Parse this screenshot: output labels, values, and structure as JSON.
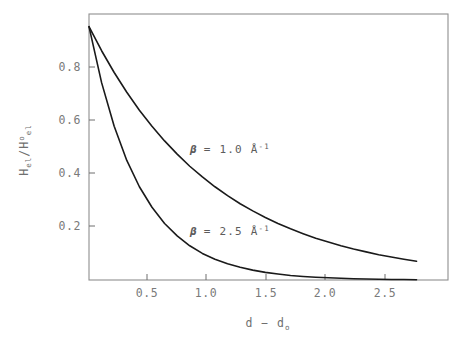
{
  "chart_data": {
    "type": "line",
    "title": "",
    "xlabel": "d - d",
    "xlabel_sub": "o",
    "ylabel_num": "H",
    "ylabel_num_sub": "el",
    "ylabel_den": "H",
    "ylabel_den_sup": "o",
    "ylabel_den_sub": "el",
    "ylabel_full": "H_el / H°_el",
    "xlim": [
      0,
      2.85
    ],
    "ylim": [
      0,
      1.05
    ],
    "xticks": [
      0.5,
      1.0,
      1.5,
      2.0,
      2.5
    ],
    "xtick_labels": [
      "0.5",
      "1.0",
      "1.5",
      "2.0",
      "2.5"
    ],
    "yticks": [
      0.2,
      0.4,
      0.6,
      0.8
    ],
    "ytick_labels": [
      "0.2",
      "0.4",
      "0.6",
      "0.8"
    ],
    "grid": false,
    "legend_position": "inline-annotation",
    "series": [
      {
        "name": "beta = 1.0",
        "beta": 1.0,
        "annotation": {
          "symbol": "β",
          "equals": "=",
          "value": "1.0",
          "unit": "Å",
          "exponent": "-1",
          "text": "β = 1.0 Å⁻¹"
        },
        "x": [
          0.0,
          0.1,
          0.2,
          0.3,
          0.4,
          0.5,
          0.6,
          0.7,
          0.8,
          0.9,
          1.0,
          1.1,
          1.2,
          1.3,
          1.4,
          1.5,
          1.6,
          1.7,
          1.8,
          1.9,
          2.0,
          2.1,
          2.2,
          2.3,
          2.4,
          2.5,
          2.6
        ],
        "y": [
          1.0,
          0.905,
          0.819,
          0.741,
          0.67,
          0.607,
          0.549,
          0.497,
          0.449,
          0.407,
          0.368,
          0.333,
          0.301,
          0.273,
          0.247,
          0.223,
          0.202,
          0.183,
          0.165,
          0.15,
          0.135,
          0.122,
          0.111,
          0.1,
          0.091,
          0.082,
          0.074
        ]
      },
      {
        "name": "beta = 2.5",
        "beta": 2.5,
        "annotation": {
          "symbol": "β",
          "equals": "=",
          "value": "2.5",
          "unit": "Å",
          "exponent": "-1",
          "text": "β = 2.5 Å⁻¹"
        },
        "x": [
          0.0,
          0.1,
          0.2,
          0.3,
          0.4,
          0.5,
          0.6,
          0.7,
          0.8,
          0.9,
          1.0,
          1.1,
          1.2,
          1.3,
          1.4,
          1.5,
          1.6,
          1.7,
          1.8,
          1.9,
          2.0,
          2.1,
          2.2,
          2.3,
          2.4,
          2.5,
          2.6
        ],
        "y": [
          1.0,
          0.779,
          0.607,
          0.472,
          0.368,
          0.287,
          0.223,
          0.174,
          0.135,
          0.105,
          0.082,
          0.064,
          0.05,
          0.039,
          0.03,
          0.024,
          0.018,
          0.014,
          0.011,
          0.009,
          0.007,
          0.005,
          0.004,
          0.003,
          0.002,
          0.002,
          0.001
        ]
      }
    ],
    "equation": "H_el/H°_el = exp(-β(d-d₀))",
    "colors": {
      "curve": "#1a1a1a",
      "frame": "#8a8a8a",
      "text": "#6f6f6f"
    }
  },
  "annotations": {
    "beta1": {
      "symbol": "β",
      "rest": "= 1.0 Å",
      "exp": "-1"
    },
    "beta2": {
      "symbol": "β",
      "rest": "= 2.5 Å",
      "exp": "-1"
    }
  },
  "axes": {
    "x_title_main": "d  −  d",
    "x_title_sub": "o",
    "y_num": "H",
    "y_num_sub": "el",
    "y_slash": "/",
    "y_den": "H",
    "y_den_sup": "o",
    "y_den_sub": "el"
  }
}
